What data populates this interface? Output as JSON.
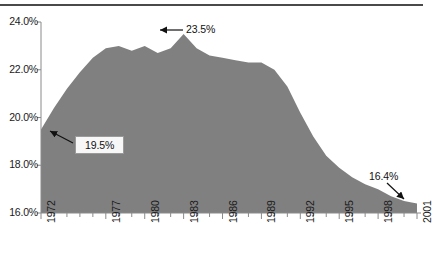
{
  "chart_data": {
    "type": "area",
    "title": "",
    "subtitle": "",
    "xlabel": "",
    "ylabel": "",
    "xlim": [
      1972,
      2001
    ],
    "ylim": [
      16.0,
      24.0
    ],
    "grid": false,
    "legend": false,
    "fill_color": "#808080",
    "axis_color": "#8a8a8a",
    "y_ticks": [
      "24.0%",
      "22.0%",
      "20.0%",
      "18.0%",
      "16.0%"
    ],
    "y_tick_values": [
      24.0,
      22.0,
      20.0,
      18.0,
      16.0
    ],
    "x_ticks": [
      "1972",
      "1977",
      "1980",
      "1983",
      "1986",
      "1989",
      "1992",
      "1995",
      "1998",
      "2001"
    ],
    "x_tick_values": [
      1972,
      1977,
      1980,
      1983,
      1986,
      1989,
      1992,
      1995,
      1998,
      2001
    ],
    "x": [
      1972,
      1973,
      1974,
      1975,
      1976,
      1977,
      1978,
      1979,
      1980,
      1981,
      1982,
      1983,
      1984,
      1985,
      1986,
      1987,
      1988,
      1989,
      1990,
      1991,
      1992,
      1993,
      1994,
      1995,
      1996,
      1997,
      1998,
      1999,
      2000,
      2001
    ],
    "values": [
      19.5,
      20.4,
      21.2,
      21.9,
      22.5,
      22.9,
      23.0,
      22.8,
      23.0,
      22.7,
      22.9,
      23.5,
      22.9,
      22.6,
      22.5,
      22.4,
      22.3,
      22.3,
      22.0,
      21.3,
      20.2,
      19.2,
      18.4,
      17.9,
      17.5,
      17.2,
      17.0,
      16.7,
      16.5,
      16.4
    ],
    "annotations": [
      {
        "label": "23.5%",
        "year": 1983,
        "value": 23.5,
        "arrow": "left"
      },
      {
        "label": "19.5%",
        "year": 1972,
        "value": 19.5,
        "arrow": "up-left",
        "boxed": true
      },
      {
        "label": "16.4%",
        "year": 2001,
        "value": 16.4,
        "arrow": "down-right"
      }
    ]
  }
}
